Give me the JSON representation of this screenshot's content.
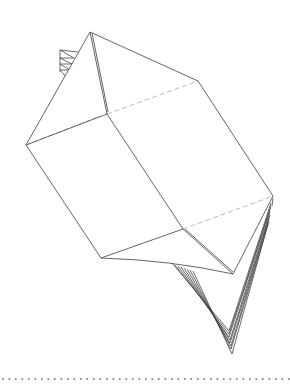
{
  "diagram": {
    "title": "Folded paper box with pleated flaps",
    "stroke_color": "#555555",
    "hidden_edge_color": "#b0b0b0",
    "dotted_rule_color": "#666666",
    "vertices": {
      "top": [
        90,
        32
      ],
      "top_right": [
        198,
        81
      ],
      "left": [
        26,
        145
      ],
      "front_mid": [
        107,
        114
      ],
      "right_low": [
        273,
        196
      ],
      "bottom_left": [
        101,
        258
      ],
      "bottom_mid": [
        183,
        229
      ],
      "front_bottom": [
        233,
        274
      ],
      "fan_tip": [
        232,
        354
      ]
    },
    "upper_pleats": 4,
    "lower_pleats": 8,
    "separator": "dotted-rule"
  }
}
